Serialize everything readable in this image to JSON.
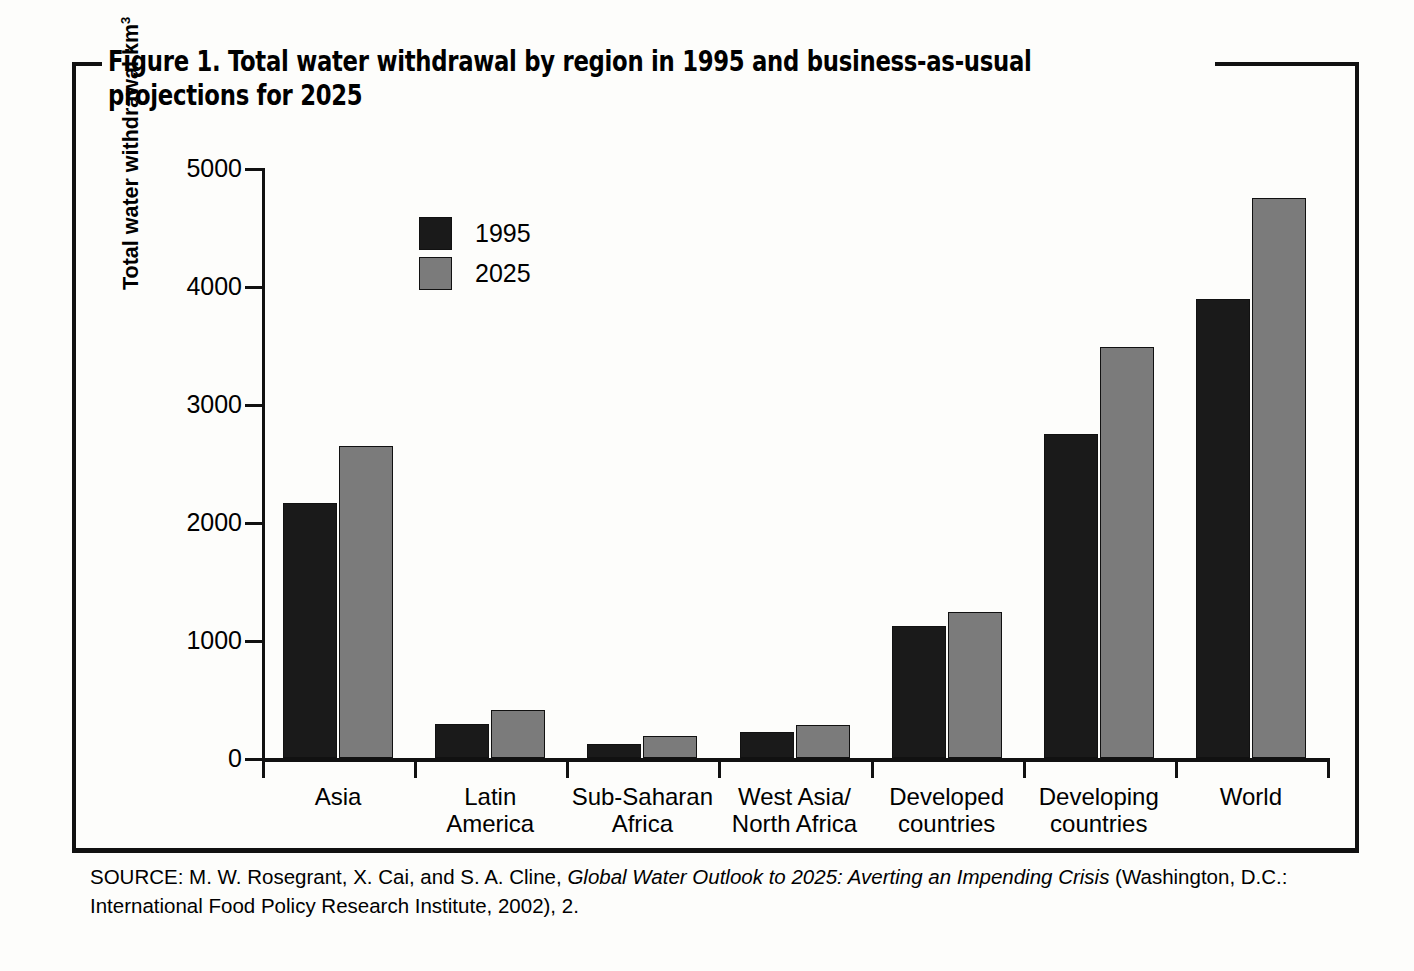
{
  "figure": {
    "title": "Figure 1. Total water withdrawal by region in 1995 and business-as-usual projections for 2025",
    "source_prefix": "SOURCE: M. W. Rosegrant, X. Cai, and S. A. Cline, ",
    "source_italic": "Global Water Outlook to 2025: Averting an Impending Crisis",
    "source_suffix": " (Washington, D.C.: International Food Policy Research Institute, 2002), 2."
  },
  "colors": {
    "series_1995": "#1a1a1a",
    "series_2025": "#7b7b7b",
    "axis": "#111111",
    "frame": "#111111",
    "background": "#fdfdfb"
  },
  "chart_data": {
    "type": "bar",
    "title": "Figure 1. Total water withdrawal by region in 1995 and business-as-usual projections for 2025",
    "xlabel": "",
    "ylabel": "Total water withdrawal km³",
    "ylim": [
      0,
      5000
    ],
    "yticks": [
      0,
      1000,
      2000,
      3000,
      4000,
      5000
    ],
    "ytick_labels": [
      "0",
      "1000",
      "2000",
      "3000",
      "4000",
      "5000"
    ],
    "grid": false,
    "legend_position": "upper-left-inside",
    "categories": [
      "Asia",
      "Latin America",
      "Sub-Saharan Africa",
      "West Asia/North Africa",
      "Developed countries",
      "Developing countries",
      "World"
    ],
    "category_label_lines": [
      [
        "Asia"
      ],
      [
        "Latin",
        "America"
      ],
      [
        "Sub-Saharan",
        "Africa"
      ],
      [
        "West Asia/",
        "North Africa"
      ],
      [
        "Developed",
        "countries"
      ],
      [
        "Developing",
        "countries"
      ],
      [
        "World"
      ]
    ],
    "series": [
      {
        "name": "1995",
        "color": "#1a1a1a",
        "values": [
          2160,
          290,
          120,
          220,
          1120,
          2750,
          3890
        ]
      },
      {
        "name": "2025",
        "color": "#7b7b7b",
        "values": [
          2640,
          410,
          190,
          280,
          1240,
          3480,
          4750
        ]
      }
    ]
  },
  "legend": {
    "items": [
      {
        "label": "1995",
        "swatch": "series-1995-swatch"
      },
      {
        "label": "2025",
        "swatch": "series-2025-swatch"
      }
    ]
  }
}
